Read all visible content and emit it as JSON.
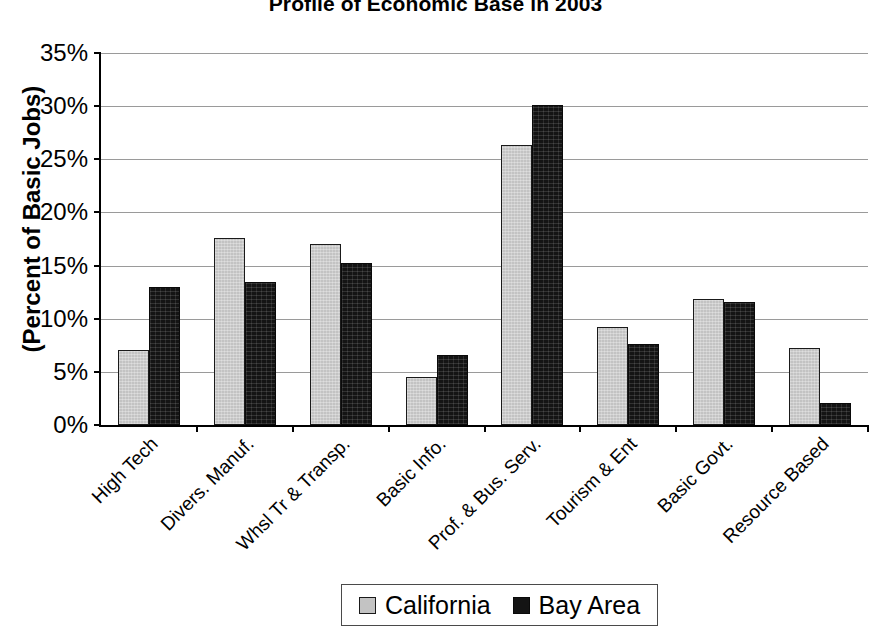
{
  "chart_data": {
    "type": "bar",
    "title": "Profile of Economic Base in 2003",
    "xlabel": "",
    "ylabel": "(Percent of Basic Jobs)",
    "ylim": [
      0,
      35
    ],
    "ytick_labels": [
      "35%",
      "30%",
      "25%",
      "20%",
      "15%",
      "10%",
      "5%",
      "0%"
    ],
    "ytick_values": [
      35,
      30,
      25,
      20,
      15,
      10,
      5,
      0
    ],
    "grid": true,
    "legend_position": "bottom",
    "categories": [
      "High Tech",
      "Divers. Manuf.",
      "Whsl Tr & Transp.",
      "Basic Info.",
      "Prof. & Bus. Serv.",
      "Tourism & Ent",
      "Basic Govt.",
      "Resource Based"
    ],
    "series": [
      {
        "name": "California",
        "color": "#c3c3c3",
        "values": [
          7.1,
          17.6,
          17.0,
          4.5,
          26.3,
          9.2,
          11.9,
          7.2
        ]
      },
      {
        "name": "Bay Area",
        "color": "#141414",
        "values": [
          13.0,
          13.5,
          15.2,
          6.6,
          30.1,
          7.6,
          11.6,
          2.1
        ]
      }
    ]
  },
  "legend": {
    "entries": [
      {
        "label": "California",
        "swatch": "legend-swatch-california"
      },
      {
        "label": "Bay Area",
        "swatch": "legend-swatch-bay-area"
      }
    ]
  }
}
